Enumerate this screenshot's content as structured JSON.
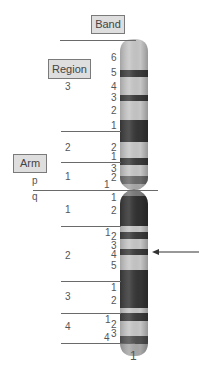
{
  "labels": {
    "band": "Band",
    "region": "Region",
    "arm": "Arm",
    "p_arm": "p",
    "q_arm": "q",
    "chromosome_number": "1"
  },
  "p_arm": {
    "regions": [
      {
        "region": "3",
        "bands": [
          "6",
          "5",
          "4",
          "3",
          "2",
          "1"
        ]
      },
      {
        "region": "2",
        "bands": [
          "2",
          "1"
        ]
      },
      {
        "region": "1",
        "bands": [
          "3",
          "2",
          "1"
        ]
      }
    ]
  },
  "q_arm": {
    "regions": [
      {
        "region": "1",
        "bands": [
          "1",
          "2"
        ]
      },
      {
        "region": "2",
        "bands": [
          "1",
          "2",
          "3",
          "4",
          "5"
        ]
      },
      {
        "region": "3",
        "bands": [
          "1",
          "2"
        ]
      },
      {
        "region": "4",
        "bands": [
          "1",
          "2",
          "3",
          "4"
        ]
      }
    ]
  },
  "colors": {
    "light_band": "#c4c4c4",
    "dark_band": "#3a3a3a",
    "medium_band": "#8a8a8a",
    "box_fill": "#dedede",
    "line": "#6a6a6a"
  },
  "arrow": {
    "points_to": "q24"
  }
}
